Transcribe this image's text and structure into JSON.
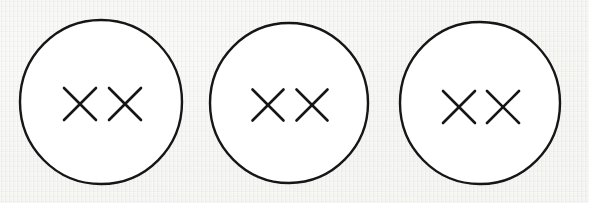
{
  "scene": {
    "title": "Three hand-drawn circles each containing two X marks",
    "width": 589,
    "height": 203,
    "background_color": "#eeeeea",
    "ink_color": "#161616",
    "circle_fill_color": "#ffffff",
    "medium": "hand-drawn ink on paper"
  },
  "circles": [
    {
      "id": "circle-1",
      "label": "Circle 1",
      "center_x": 101,
      "center_y": 102,
      "radius_x": 81,
      "radius_y": 82,
      "stroke_width": 2.4,
      "marks": [
        {
          "id": "circle-1-x-1",
          "label": "X",
          "center_x": 80,
          "center_y": 104,
          "size": 32
        },
        {
          "id": "circle-1-x-2",
          "label": "X",
          "center_x": 125,
          "center_y": 104,
          "size": 32
        }
      ]
    },
    {
      "id": "circle-2",
      "label": "Circle 2",
      "center_x": 289,
      "center_y": 103,
      "radius_x": 79,
      "radius_y": 80,
      "stroke_width": 2.4,
      "marks": [
        {
          "id": "circle-2-x-1",
          "label": "X",
          "center_x": 268,
          "center_y": 105,
          "size": 31
        },
        {
          "id": "circle-2-x-2",
          "label": "X",
          "center_x": 312,
          "center_y": 105,
          "size": 31
        }
      ]
    },
    {
      "id": "circle-3",
      "label": "Circle 3",
      "center_x": 480,
      "center_y": 103,
      "radius_x": 80,
      "radius_y": 81,
      "stroke_width": 2.4,
      "marks": [
        {
          "id": "circle-3-x-1",
          "label": "X",
          "center_x": 459,
          "center_y": 107,
          "size": 32
        },
        {
          "id": "circle-3-x-2",
          "label": "X",
          "center_x": 503,
          "center_y": 107,
          "size": 32
        }
      ]
    }
  ],
  "summary": {
    "circle_count": 3,
    "marks_per_circle": 2,
    "total_marks": 6,
    "mark_glyph": "X"
  }
}
